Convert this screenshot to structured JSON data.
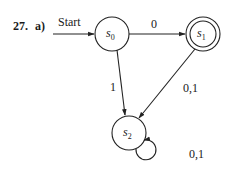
{
  "problem": {
    "number": "27.",
    "part": "a)"
  },
  "automaton": {
    "start_label": "Start",
    "states": [
      {
        "id": "s0",
        "base": "s",
        "sub": "0",
        "accepting": false,
        "start": true
      },
      {
        "id": "s1",
        "base": "s",
        "sub": "1",
        "accepting": true,
        "start": false
      },
      {
        "id": "s2",
        "base": "s",
        "sub": "2",
        "accepting": false,
        "start": false
      }
    ],
    "transitions": [
      {
        "from": "s0",
        "to": "s1",
        "label": "0"
      },
      {
        "from": "s0",
        "to": "s2",
        "label": "1"
      },
      {
        "from": "s1",
        "to": "s2",
        "label": "0,1"
      },
      {
        "from": "s2",
        "to": "s2",
        "label": "0,1"
      }
    ]
  },
  "colors": {
    "stroke": "#222222",
    "text": "#1a1a1a",
    "background": "#ffffff"
  }
}
